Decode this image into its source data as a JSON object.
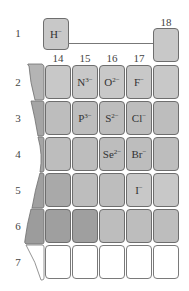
{
  "rows": [
    "1",
    "2",
    "3",
    "4",
    "5",
    "6",
    "7"
  ],
  "column_headers": [
    "14",
    "15",
    "16",
    "17",
    "18"
  ],
  "hydride": {
    "symbol": "H",
    "charge": "−"
  },
  "ions": [
    {
      "symbol": "N",
      "charge": "3−",
      "row": 2,
      "group": 15
    },
    {
      "symbol": "O",
      "charge": "2−",
      "row": 2,
      "group": 16
    },
    {
      "symbol": "F",
      "charge": "−",
      "row": 2,
      "group": 17
    },
    {
      "symbol": "P",
      "charge": "3−",
      "row": 3,
      "group": 15
    },
    {
      "symbol": "S",
      "charge": "2−",
      "row": 3,
      "group": 16
    },
    {
      "symbol": "Cl",
      "charge": "−",
      "row": 3,
      "group": 17
    },
    {
      "symbol": "Se",
      "charge": "2−",
      "row": 4,
      "group": 16
    },
    {
      "symbol": "Br",
      "charge": "−",
      "row": 4,
      "group": 17
    },
    {
      "symbol": "I",
      "charge": "−",
      "row": 5,
      "group": 17
    }
  ],
  "cells": {
    "r2": {
      "g15": {
        "sym": "N",
        "chg": "3−"
      },
      "g16": {
        "sym": "O",
        "chg": "2−"
      },
      "g17": {
        "sym": "F",
        "chg": "−"
      }
    },
    "r3": {
      "g15": {
        "sym": "P",
        "chg": "3−"
      },
      "g16": {
        "sym": "S",
        "chg": "2−"
      },
      "g17": {
        "sym": "Cl",
        "chg": "−"
      }
    },
    "r4": {
      "g16": {
        "sym": "Se",
        "chg": "2−"
      },
      "g17": {
        "sym": "Br",
        "chg": "−"
      }
    },
    "r5": {
      "g17": {
        "sym": "I",
        "chg": "−"
      }
    }
  },
  "colors": {
    "light": "#c8c8c8",
    "mid": "#bdbdbd",
    "dark": "#a9a9a9",
    "darker": "#9f9f9f",
    "empty": "#ffffff",
    "border": "#6e6e6e"
  }
}
